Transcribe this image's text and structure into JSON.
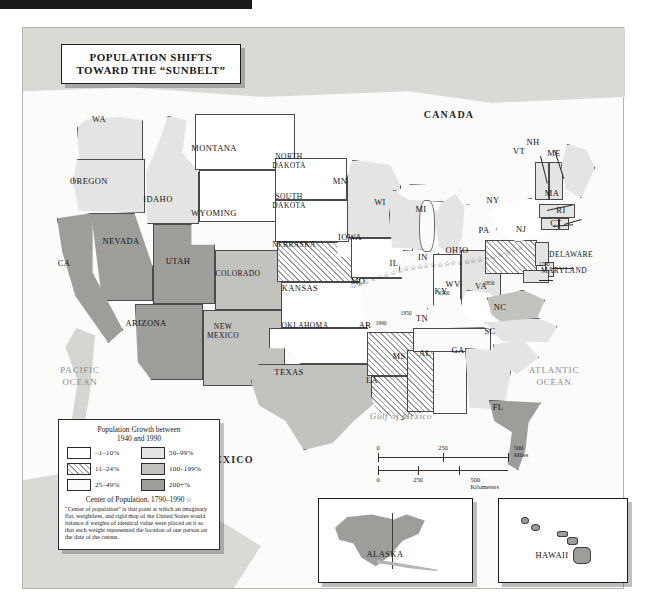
{
  "title": {
    "line1": "POPULATION SHIFTS",
    "line2": "TOWARD THE “SUNBELT”"
  },
  "countries": {
    "canada": "CANADA",
    "mexico": "MEXICO"
  },
  "oceans": {
    "pacific_l1": "PACIFIC",
    "pacific_l2": "OCEAN",
    "atlantic_l1": "ATLANTIC",
    "atlantic_l2": "OCEAN",
    "gulf": "Gulf of Mexico"
  },
  "legend": {
    "heading_l1": "Population Growth between",
    "heading_l2": "1940 and 1990",
    "classes": [
      {
        "label": "–1–10%",
        "key": "g1",
        "color": "#ffffff"
      },
      {
        "label": "50–99%",
        "key": "g4",
        "color": "#e4e4e2"
      },
      {
        "label": "11–24%",
        "key": "g2",
        "color": "#ffffff"
      },
      {
        "label": "100–199%",
        "key": "g5",
        "color": "#c2c2bf"
      },
      {
        "label": "25–49%",
        "key": "g3",
        "color": "#fbfbfb"
      },
      {
        "label": "200+%",
        "key": "g6",
        "color": "#9d9d9a"
      }
    ],
    "center_title": "Center of Population, 1790–1990 ☆",
    "note": "“Center of population” is that point at which an imaginary flat, weightless, and rigid map of the United States would balance if weights of identical value were placed on it so that each weight represented the location of one person on the date of the census."
  },
  "scale": {
    "miles_ticks": [
      "0",
      "250",
      "500 Miles"
    ],
    "km_ticks": [
      "0",
      "250",
      "500 Kilometers"
    ]
  },
  "center_of_population_years": [
    "1790",
    "1850",
    "1900",
    "1950",
    "1990"
  ],
  "insets": [
    {
      "name": "ALASKA"
    },
    {
      "name": "HAWAII"
    }
  ],
  "states": [
    {
      "abbr": "WA",
      "name": "Washington",
      "class": "g4",
      "x": 98,
      "y": 118
    },
    {
      "abbr": "OREGON",
      "name": "Oregon",
      "class": "g4",
      "x": 88,
      "y": 180
    },
    {
      "abbr": "IDAHO",
      "name": "Idaho",
      "class": "g4",
      "x": 157,
      "y": 198
    },
    {
      "abbr": "MONTANA",
      "name": "Montana",
      "class": "g1",
      "x": 213,
      "y": 147
    },
    {
      "abbr": "WYOMING",
      "name": "Wyoming",
      "class": "g1",
      "x": 213,
      "y": 212
    },
    {
      "abbr": "NEVADA",
      "name": "Nevada",
      "class": "g6",
      "x": 120,
      "y": 240
    },
    {
      "abbr": "UTAH",
      "name": "Utah",
      "class": "g6",
      "x": 177,
      "y": 260
    },
    {
      "abbr": "CA",
      "name": "California",
      "class": "g6",
      "x": 63,
      "y": 262
    },
    {
      "abbr": "COLORADO",
      "name": "Colorado",
      "class": "g5",
      "x": 237,
      "y": 272
    },
    {
      "abbr": "ARIZONA",
      "name": "Arizona",
      "class": "g6",
      "x": 145,
      "y": 322
    },
    {
      "abbr": "NEW\nMEXICO",
      "name": "New Mexico",
      "class": "g5",
      "x": 222,
      "y": 330
    },
    {
      "abbr": "NORTH\nDAKOTA",
      "name": "North Dakota",
      "class": "g1",
      "x": 288,
      "y": 160
    },
    {
      "abbr": "SOUTH\nDAKOTA",
      "name": "South Dakota",
      "class": "g1",
      "x": 288,
      "y": 200
    },
    {
      "abbr": "NEBRASKA",
      "name": "Nebraska",
      "class": "g2",
      "x": 293,
      "y": 243
    },
    {
      "abbr": "KANSAS",
      "name": "Kansas",
      "class": "g1",
      "x": 299,
      "y": 287
    },
    {
      "abbr": "OKLAHOMA",
      "name": "Oklahoma",
      "class": "g1",
      "x": 304,
      "y": 324
    },
    {
      "abbr": "TEXAS",
      "name": "Texas",
      "class": "g5",
      "x": 288,
      "y": 371
    },
    {
      "abbr": "MN",
      "name": "Minnesota",
      "class": "g4",
      "x": 339,
      "y": 180
    },
    {
      "abbr": "IOWA",
      "name": "Iowa",
      "class": "g1",
      "x": 349,
      "y": 236
    },
    {
      "abbr": "MO",
      "name": "Missouri",
      "class": "g3",
      "x": 357,
      "y": 280
    },
    {
      "abbr": "AR",
      "name": "Arkansas",
      "class": "g2",
      "x": 364,
      "y": 324
    },
    {
      "abbr": "LA",
      "name": "Louisiana",
      "class": "g2",
      "x": 371,
      "y": 379
    },
    {
      "abbr": "WI",
      "name": "Wisconsin",
      "class": "g4",
      "x": 379,
      "y": 201
    },
    {
      "abbr": "IL",
      "name": "Illinois",
      "class": "g3",
      "x": 393,
      "y": 262
    },
    {
      "abbr": "MS",
      "name": "Mississippi",
      "class": "g2",
      "x": 398,
      "y": 355
    },
    {
      "abbr": "MI",
      "name": "Michigan",
      "class": "g4",
      "x": 420,
      "y": 208
    },
    {
      "abbr": "IN",
      "name": "Indiana",
      "class": "g3",
      "x": 422,
      "y": 256
    },
    {
      "abbr": "AL",
      "name": "Alabama",
      "class": "g3",
      "x": 424,
      "y": 352
    },
    {
      "abbr": "TN",
      "name": "Tennessee",
      "class": "g3",
      "x": 421,
      "y": 317
    },
    {
      "abbr": "KY",
      "name": "Kentucky",
      "class": "g3",
      "x": 440,
      "y": 290
    },
    {
      "abbr": "OHIO",
      "name": "Ohio",
      "class": "g4",
      "x": 456,
      "y": 249
    },
    {
      "abbr": "GA",
      "name": "Georgia",
      "class": "g4",
      "x": 457,
      "y": 349
    },
    {
      "abbr": "WV",
      "name": "West Virginia",
      "class": "g1",
      "x": 452,
      "y": 283
    },
    {
      "abbr": "VA",
      "name": "Virginia",
      "class": "g5",
      "x": 480,
      "y": 285
    },
    {
      "abbr": "SC",
      "name": "South Carolina",
      "class": "g4",
      "x": 489,
      "y": 330
    },
    {
      "abbr": "NC",
      "name": "North Carolina",
      "class": "g4",
      "x": 499,
      "y": 306
    },
    {
      "abbr": "PA",
      "name": "Pennsylvania",
      "class": "g2",
      "x": 483,
      "y": 229
    },
    {
      "abbr": "NY",
      "name": "New York",
      "class": "g1",
      "x": 492,
      "y": 199
    },
    {
      "abbr": "VT",
      "name": "Vermont",
      "class": "g4",
      "x": 518,
      "y": 150
    },
    {
      "abbr": "NH",
      "name": "New Hampshire",
      "class": "g4",
      "x": 532,
      "y": 141
    },
    {
      "abbr": "ME",
      "name": "Maine",
      "class": "g4",
      "x": 553,
      "y": 152
    },
    {
      "abbr": "MA",
      "name": "Massachusetts",
      "class": "g4",
      "x": 551,
      "y": 192
    },
    {
      "abbr": "RI",
      "name": "Rhode Island",
      "class": "g4",
      "x": 560,
      "y": 209
    },
    {
      "abbr": "CT",
      "name": "Connecticut",
      "class": "g4",
      "x": 555,
      "y": 222
    },
    {
      "abbr": "NJ",
      "name": "New Jersey",
      "class": "g4",
      "x": 520,
      "y": 228
    },
    {
      "abbr": "DELAWARE",
      "name": "Delaware",
      "class": "g4",
      "x": 570,
      "y": 253
    },
    {
      "abbr": "MARYLAND",
      "name": "Maryland",
      "class": "g4",
      "x": 563,
      "y": 269
    },
    {
      "abbr": "FL",
      "name": "Florida",
      "class": "g6",
      "x": 497,
      "y": 406
    }
  ]
}
